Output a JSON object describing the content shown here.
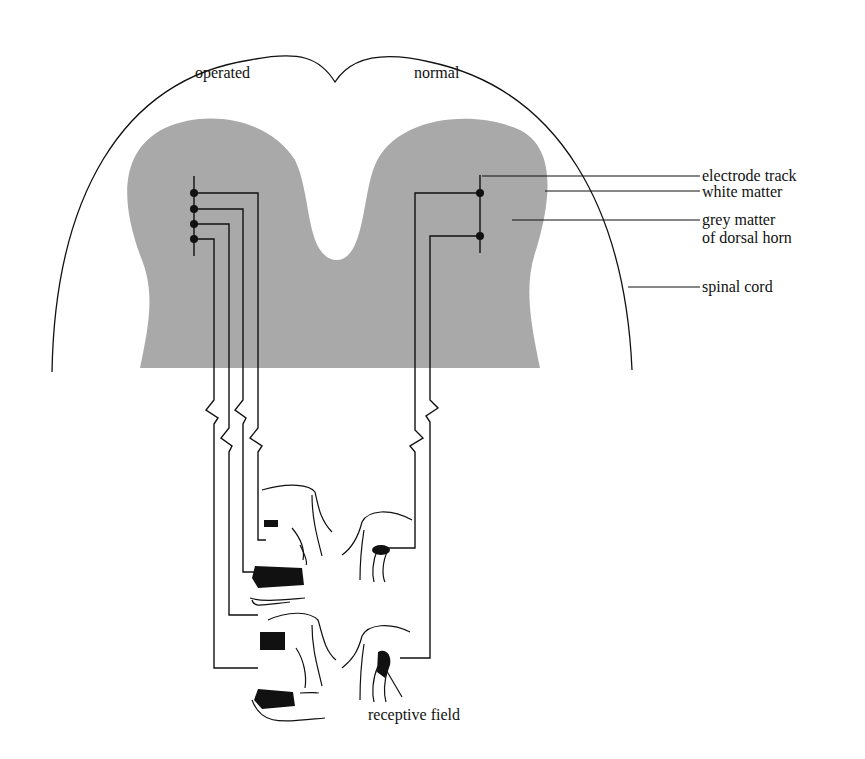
{
  "diagram": {
    "title_labels": {
      "left_side": "operated",
      "right_side": "normal"
    },
    "callouts": [
      {
        "id": "white-matter",
        "text": "white matter"
      },
      {
        "id": "electrode-track",
        "text": "electrode track"
      },
      {
        "id": "grey-matter",
        "text": "grey matter\nof dorsal horn"
      },
      {
        "id": "spinal-cord",
        "text": "spinal cord"
      }
    ],
    "bottom_label": "receptive field",
    "colors": {
      "grey_matter": "#a9a9a9",
      "line": "#111111",
      "receptive_field_fill": "#111111",
      "background": "#ffffff"
    },
    "recording_sites": {
      "operated_side_count": 4,
      "normal_side_count": 2
    },
    "cat_drawings": {
      "operated_side": [
        "cat hindlimb - small field on paw",
        "cat hind paw - large field",
        "cat hindlimb - ankle field",
        "cat hind paw - large field"
      ],
      "normal_side": [
        "cat hindlimb - small field",
        "cat hindlimb - thigh field"
      ]
    }
  }
}
